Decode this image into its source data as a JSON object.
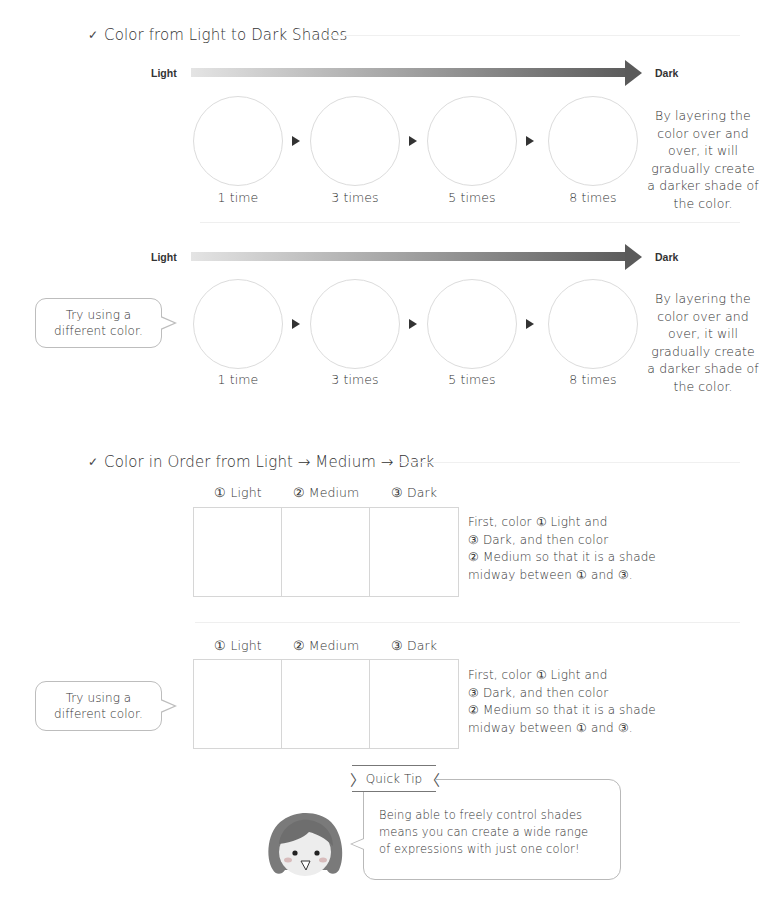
{
  "section1": {
    "title": "Color from Light to Dark Shades",
    "check_icon": "✓",
    "rows": [
      {
        "scale": {
          "light": "Light",
          "dark": "Dark"
        },
        "steps": [
          "1 time",
          "3 times",
          "5 times",
          "8 times"
        ],
        "note": [
          "By layering the",
          "color over and",
          "over, it will",
          "gradually create",
          "a darker shade of",
          "the color."
        ]
      },
      {
        "scale": {
          "light": "Light",
          "dark": "Dark"
        },
        "bubble": [
          "Try using a",
          "different color."
        ],
        "steps": [
          "1 time",
          "3 times",
          "5 times",
          "8 times"
        ],
        "note": [
          "By layering the",
          "color over and",
          "over, it will",
          "gradually create",
          "a darker shade of",
          "the color."
        ]
      }
    ]
  },
  "section2": {
    "title": "Color in Order from Light → Medium → Dark",
    "check_icon": "✓",
    "rows": [
      {
        "columns": [
          "① Light",
          "② Medium",
          "③ Dark"
        ],
        "note": [
          "First, color ① Light and",
          "③ Dark, and then color",
          "② Medium so that it is a shade",
          "midway between ① and ③."
        ]
      },
      {
        "bubble": [
          "Try using a",
          "different color."
        ],
        "columns": [
          "① Light",
          "② Medium",
          "③ Dark"
        ],
        "note": [
          "First, color ① Light and",
          "③ Dark, and then color",
          "② Medium so that it is a shade",
          "midway between ① and ③."
        ]
      }
    ]
  },
  "quick_tip": {
    "label": "Quick Tip",
    "body": [
      "Being able to freely control shades",
      "means you can create a wide range",
      "of expressions with just one color!"
    ]
  },
  "colors": {
    "gradient_start": "#e4e4e4",
    "gradient_end": "#5a5a5a",
    "outline": "#dcdcdc",
    "text": "#333333"
  }
}
